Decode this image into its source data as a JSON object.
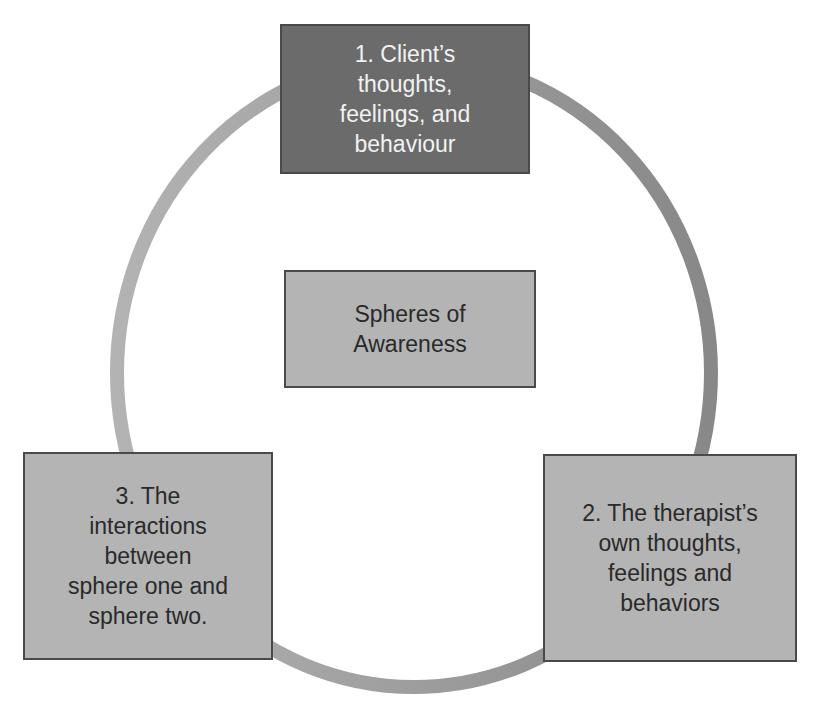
{
  "diagram": {
    "type": "cycle",
    "center": {
      "label": "Spheres of Awareness"
    },
    "nodes": [
      {
        "id": 1,
        "label": "1. Client’s\nthoughts,\nfeelings, and\nbehaviour",
        "fill": "#6b6b6b",
        "text_color": "#f2f2f2"
      },
      {
        "id": 2,
        "label": "2. The therapist’s\nown thoughts,\nfeelings and\nbehaviors",
        "fill": "#b4b4b4",
        "text_color": "#2a2a2a"
      },
      {
        "id": 3,
        "label": "3. The\ninteractions\nbetween\nsphere one and\nsphere two.",
        "fill": "#b4b4b4",
        "text_color": "#2a2a2a"
      }
    ],
    "ring": {
      "stroke_light": "#b0b0b0",
      "stroke_dark": "#8a8a8a"
    }
  }
}
